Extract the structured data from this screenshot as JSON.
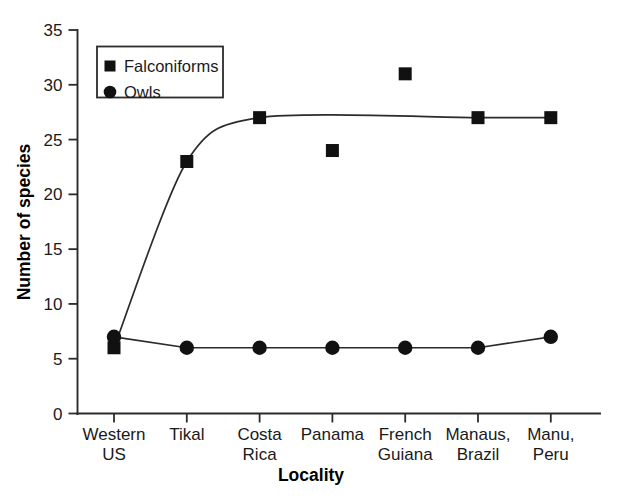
{
  "figure": {
    "background_color": "#ffffff",
    "ink_color": "#1a1a1a",
    "marker_color": "#111111"
  },
  "chart_data": {
    "type": "line",
    "title": "",
    "subtitle": "",
    "xlabel": "Locality",
    "ylabel": "Number of species",
    "categories": [
      "Western\nUS",
      "Tikal",
      "Costa\nRica",
      "Panama",
      "French\nGuiana",
      "Manaus,\nBrazil",
      "Manu,\nPeru"
    ],
    "category_lines": [
      [
        "Western",
        "US"
      ],
      [
        "Tikal",
        ""
      ],
      [
        "Costa",
        "Rica"
      ],
      [
        "Panama",
        ""
      ],
      [
        "French",
        "Guiana"
      ],
      [
        "Manaus,",
        "Brazil"
      ],
      [
        "Manu,",
        "Peru"
      ]
    ],
    "series": [
      {
        "name": "Falconiforms",
        "marker": "square",
        "values": [
          6,
          23,
          27,
          24,
          31,
          27,
          27
        ],
        "connected_indices": [
          0,
          1,
          2,
          5,
          6
        ],
        "curved": true
      },
      {
        "name": "Owls",
        "marker": "circle",
        "values": [
          7,
          6,
          6,
          6,
          6,
          6,
          7
        ],
        "connected_indices": [
          0,
          1,
          2,
          3,
          4,
          5,
          6
        ],
        "curved": false
      }
    ],
    "ylim": [
      0,
      35
    ],
    "yticks": [
      0,
      5,
      10,
      15,
      20,
      25,
      30,
      35
    ],
    "ytick_labels": [
      "0",
      "5",
      "10",
      "15",
      "20",
      "25",
      "30",
      "35"
    ],
    "grid": false,
    "legend_position": "upper-left",
    "legend_entries": [
      {
        "label": "Falconiforms",
        "marker": "square"
      },
      {
        "label": "Owls",
        "marker": "circle"
      }
    ]
  }
}
